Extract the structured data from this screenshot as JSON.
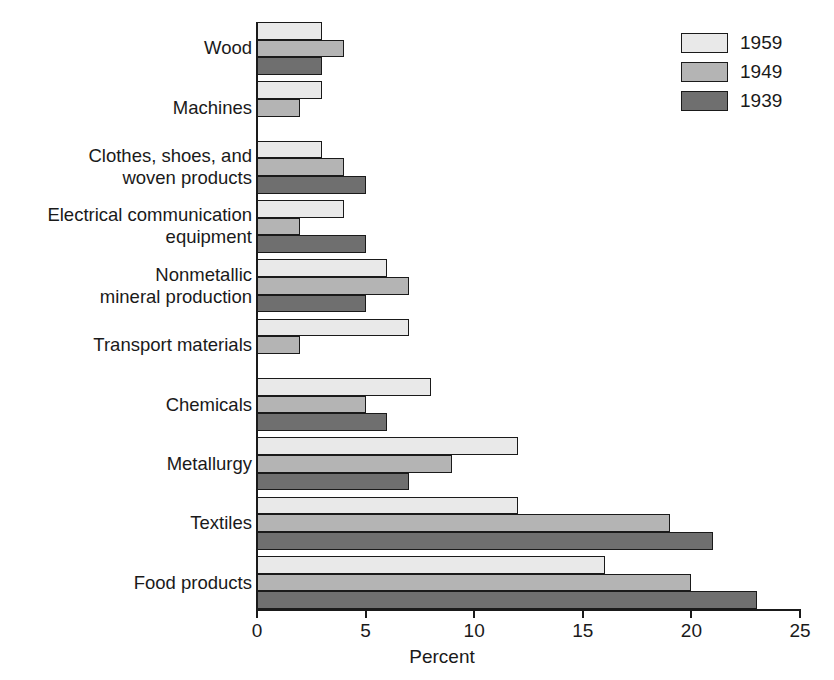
{
  "chart_data": {
    "type": "bar",
    "orientation": "horizontal",
    "title": "",
    "xlabel": "Percent",
    "ylabel": "",
    "xlim": [
      0,
      25
    ],
    "xticks": [
      0,
      5,
      10,
      15,
      20,
      25
    ],
    "xtick_labels": [
      "0",
      "5",
      "10",
      "15",
      "20",
      "25"
    ],
    "grid": false,
    "legend_position": "top-right",
    "categories": [
      "Wood",
      "Machines",
      "Clothes, shoes, and\nwoven products",
      "Electrical communication\nequipment",
      "Nonmetallic\nmineral production",
      "Transport materials",
      "Chemicals",
      "Metallurgy",
      "Textiles",
      "Food products"
    ],
    "series": [
      {
        "name": "1959",
        "color": "#e9e9e9",
        "values": [
          3,
          3,
          3,
          4,
          6,
          7,
          8,
          12,
          12,
          16
        ]
      },
      {
        "name": "1949",
        "color": "#b4b4b4",
        "values": [
          4,
          2,
          4,
          2,
          7,
          2,
          5,
          9,
          19,
          20
        ]
      },
      {
        "name": "1939",
        "color": "#6f6f6f",
        "values": [
          3,
          0,
          5,
          5,
          5,
          0,
          6,
          7,
          21,
          23
        ]
      }
    ]
  },
  "legend": {
    "entries": [
      {
        "label": "1959"
      },
      {
        "label": "1949"
      },
      {
        "label": "1939"
      }
    ]
  },
  "axis": {
    "x_title": "Percent"
  },
  "colors": {
    "series_1959": "#e9e9e9",
    "series_1949": "#b4b4b4",
    "series_1939": "#6f6f6f",
    "ink": "#1a1a1a",
    "background": "#ffffff"
  }
}
